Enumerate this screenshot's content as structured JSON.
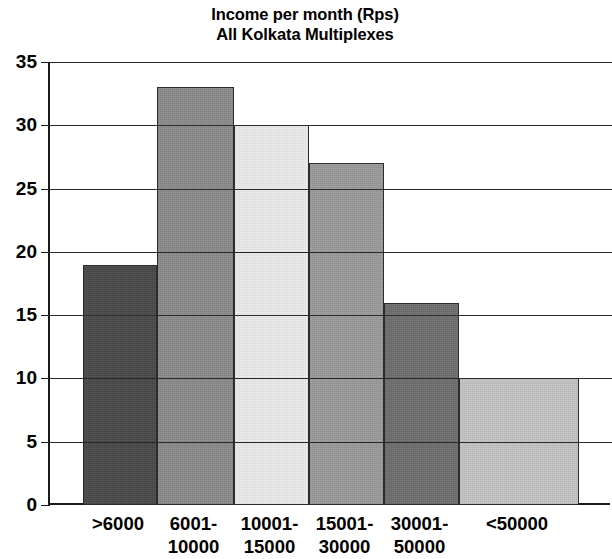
{
  "chart_data": {
    "type": "bar",
    "title": "Income per month (Rps)\nAll Kolkata Multiplexes",
    "title_lines": [
      "Income per month (Rps)",
      "All Kolkata Multiplexes"
    ],
    "categories": [
      ">6000",
      "6001-10000",
      "10001-15000",
      "15001-30000",
      "30001-50000",
      "<50000"
    ],
    "category_lines": [
      [
        ">6000"
      ],
      [
        "6001-",
        "10000"
      ],
      [
        "10001-",
        "15000"
      ],
      [
        "15001-",
        "30000"
      ],
      [
        "30001-",
        "50000"
      ],
      [
        "<50000"
      ]
    ],
    "values": [
      19,
      33,
      30,
      27,
      16,
      10
    ],
    "bar_colors": [
      "#484848",
      "#8a8a8a",
      "#ececec",
      "#9b9b9b",
      "#6e6e6e",
      "#c4c4c4"
    ],
    "xlabel": "",
    "ylabel": "",
    "ylim": [
      0,
      35
    ],
    "ytick_step": 5,
    "yticks": [
      35,
      30,
      25,
      20,
      15,
      10,
      5,
      0
    ],
    "ytick_labels": [
      "35",
      "30",
      "25",
      "20",
      "15",
      "10",
      "5",
      "0"
    ],
    "grid": "horizontal",
    "legend": "none",
    "bar_edge_color": "#2d2d2d",
    "axis_color": "#1a1a1a",
    "background": "#ffffff"
  }
}
